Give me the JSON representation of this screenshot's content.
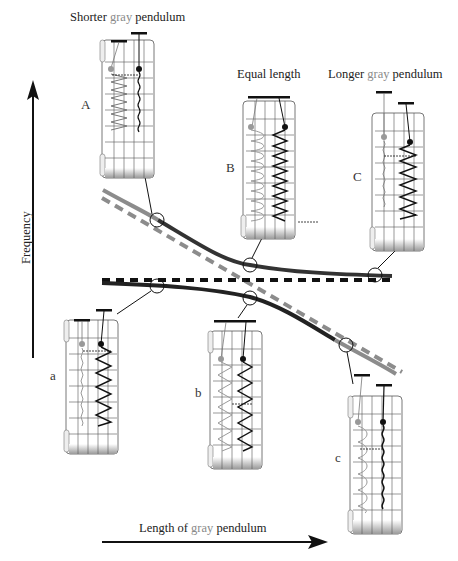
{
  "titles": {
    "shorter": {
      "prefix": "Shorter ",
      "gray": "gray",
      "suffix": " pendulum"
    },
    "equal": "Equal length",
    "longer": {
      "prefix": "Longer ",
      "gray": "gray",
      "suffix": " pendulum"
    }
  },
  "axes": {
    "y_label": "Frequency",
    "x_label": {
      "prefix": "Length of ",
      "gray": "gray",
      "suffix": " pendulum"
    }
  },
  "panels": {
    "upper": [
      "A",
      "B",
      "C"
    ],
    "lower": [
      "a",
      "b",
      "c"
    ]
  },
  "colors": {
    "black_line": "#1a1a1a",
    "gray_line": "#8c8c8c",
    "background": "#ffffff"
  },
  "curves": [
    {
      "name": "upper-branch",
      "style": "solid",
      "description": "high mode: gray-like at short lengths, black-like at long lengths"
    },
    {
      "name": "lower-branch",
      "style": "solid",
      "description": "low mode: black-like at short lengths, gray-like at long lengths"
    },
    {
      "name": "black-uncoupled",
      "style": "dashed-black",
      "description": "horizontal reference, black pendulum frequency"
    },
    {
      "name": "gray-uncoupled",
      "style": "dashed-gray",
      "description": "decreasing with gray length"
    }
  ]
}
